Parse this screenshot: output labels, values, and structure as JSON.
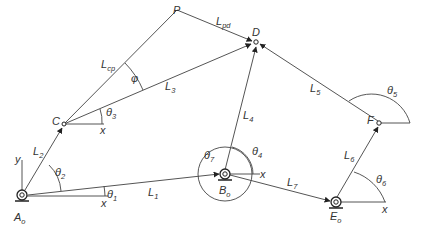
{
  "diagram": {
    "type": "linkage-mechanism",
    "points": {
      "A0": {
        "label": "A",
        "sub": "o",
        "x": 22,
        "y": 195
      },
      "B0": {
        "label": "B",
        "sub": "o",
        "x": 225,
        "y": 174
      },
      "E0": {
        "label": "E",
        "sub": "o",
        "x": 336,
        "y": 202
      },
      "C": {
        "label": "C",
        "x": 64,
        "y": 124
      },
      "P": {
        "label": "P",
        "x": 177,
        "y": 10
      },
      "D": {
        "label": "D",
        "x": 256,
        "y": 42
      },
      "F": {
        "label": "F",
        "x": 379,
        "y": 123
      }
    },
    "links": [
      {
        "name": "L",
        "sub": "1",
        "from": "A0",
        "to": "B0"
      },
      {
        "name": "L",
        "sub": "2",
        "from": "A0",
        "to": "C"
      },
      {
        "name": "L",
        "sub": "3",
        "from": "C",
        "to": "D"
      },
      {
        "name": "L",
        "sub": "4",
        "from": "B0",
        "to": "D"
      },
      {
        "name": "L",
        "sub": "5",
        "from": "F",
        "to": "D"
      },
      {
        "name": "L",
        "sub": "6",
        "from": "E0",
        "to": "F"
      },
      {
        "name": "L",
        "sub": "7",
        "from": "B0",
        "to": "E0"
      },
      {
        "name": "L",
        "sub": "cp",
        "from": "C",
        "to": "P"
      },
      {
        "name": "L",
        "sub": "pd",
        "from": "P",
        "to": "D"
      }
    ],
    "angles": [
      {
        "symbol": "θ",
        "sub": "1"
      },
      {
        "symbol": "θ",
        "sub": "2"
      },
      {
        "symbol": "θ",
        "sub": "3"
      },
      {
        "symbol": "θ",
        "sub": "4"
      },
      {
        "symbol": "θ",
        "sub": "5"
      },
      {
        "symbol": "θ",
        "sub": "6"
      },
      {
        "symbol": "θ",
        "sub": "7"
      },
      {
        "symbol": "φ",
        "sub": ""
      }
    ],
    "axes": {
      "x_label": "x",
      "y_label": "y"
    },
    "colors": {
      "line": "#555555",
      "text": "#333333",
      "background": "#ffffff"
    }
  }
}
